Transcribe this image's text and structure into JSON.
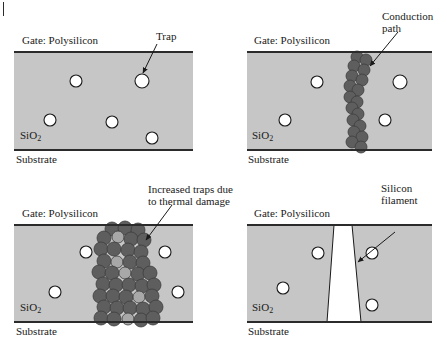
{
  "figure": {
    "type": "diagram",
    "page_tick": "|",
    "colors": {
      "oxide_fill": "#c6c6c6",
      "oxide_border": "#2b2b2b",
      "trap_fill": "#ffffff",
      "trap_stroke": "#1a1a1a",
      "defect_dark": "#5e5e5e",
      "defect_light": "#a8a8a8",
      "filament_fill": "#ffffff",
      "text": "#1a1a1a",
      "background": "#ffffff"
    },
    "common_labels": {
      "gate": "Gate: Polysilicon",
      "oxide": "SiO",
      "oxide_subscript": "2",
      "substrate": "Substrate"
    }
  },
  "panels": [
    {
      "id": "panel-a",
      "position": "top-left",
      "gate_label": "Gate: Polysilicon",
      "oxide_label": "SiO",
      "oxide_subscript": "2",
      "substrate_label": "Substrate",
      "callout": "Trap",
      "callout_lines": [
        "Trap"
      ],
      "description": "Pristine oxide with randomly distributed traps",
      "box": {
        "x": 14,
        "y": 52,
        "w": 179,
        "h": 98
      },
      "traps": [
        {
          "cx": 76,
          "cy": 81,
          "r": 6
        },
        {
          "cx": 142,
          "cy": 81,
          "r": 7
        },
        {
          "cx": 50,
          "cy": 120,
          "r": 6
        },
        {
          "cx": 112,
          "cy": 122,
          "r": 6
        },
        {
          "cx": 152,
          "cy": 138,
          "r": 6
        }
      ],
      "defects": [],
      "filament": null,
      "arrow": {
        "x1": 157,
        "y1": 44,
        "x2": 143,
        "y2": 73
      },
      "label_pos": {
        "x": 156,
        "y": 30
      },
      "gate_pos": {
        "x": 22,
        "y": 34
      },
      "oxide_pos": {
        "x": 20,
        "y": 129
      },
      "substrate_pos": {
        "x": 16,
        "y": 153
      }
    },
    {
      "id": "panel-b",
      "position": "top-right",
      "gate_label": "Gate: Polysilicon",
      "oxide_label": "SiO",
      "oxide_subscript": "2",
      "substrate_label": "Substrate",
      "callout": "Conduction path",
      "callout_lines": [
        "Conduction",
        "path"
      ],
      "description": "Traps align to form a percolation conduction path",
      "box": {
        "x": 247,
        "y": 52,
        "w": 185,
        "h": 98
      },
      "traps": [
        {
          "cx": 317,
          "cy": 82,
          "r": 6
        },
        {
          "cx": 400,
          "cy": 82,
          "r": 7
        },
        {
          "cx": 285,
          "cy": 120,
          "r": 6
        },
        {
          "cx": 385,
          "cy": 120,
          "r": 6
        }
      ],
      "defects": [
        {
          "cx": 357,
          "cy": 57,
          "r": 6,
          "shade": "dark"
        },
        {
          "cx": 366,
          "cy": 60,
          "r": 6,
          "shade": "dark"
        },
        {
          "cx": 354,
          "cy": 66,
          "r": 6,
          "shade": "dark"
        },
        {
          "cx": 364,
          "cy": 70,
          "r": 6,
          "shade": "dark"
        },
        {
          "cx": 352,
          "cy": 76,
          "r": 6,
          "shade": "dark"
        },
        {
          "cx": 362,
          "cy": 80,
          "r": 6,
          "shade": "dark"
        },
        {
          "cx": 350,
          "cy": 86,
          "r": 6,
          "shade": "dark"
        },
        {
          "cx": 358,
          "cy": 90,
          "r": 6,
          "shade": "dark"
        },
        {
          "cx": 350,
          "cy": 97,
          "r": 6,
          "shade": "dark"
        },
        {
          "cx": 357,
          "cy": 102,
          "r": 6,
          "shade": "dark"
        },
        {
          "cx": 352,
          "cy": 108,
          "r": 6,
          "shade": "dark"
        },
        {
          "cx": 358,
          "cy": 114,
          "r": 6,
          "shade": "dark"
        },
        {
          "cx": 353,
          "cy": 120,
          "r": 6,
          "shade": "dark"
        },
        {
          "cx": 360,
          "cy": 126,
          "r": 6,
          "shade": "dark"
        },
        {
          "cx": 354,
          "cy": 132,
          "r": 6,
          "shade": "dark"
        },
        {
          "cx": 362,
          "cy": 137,
          "r": 6,
          "shade": "dark"
        },
        {
          "cx": 352,
          "cy": 142,
          "r": 6,
          "shade": "dark"
        },
        {
          "cx": 361,
          "cy": 147,
          "r": 6,
          "shade": "dark"
        }
      ],
      "filament": null,
      "arrow": {
        "x1": 398,
        "y1": 32,
        "x2": 370,
        "y2": 66
      },
      "label_pos": {
        "x": 382,
        "y": 10
      },
      "gate_pos": {
        "x": 254,
        "y": 34
      },
      "oxide_pos": {
        "x": 252,
        "y": 129
      },
      "substrate_pos": {
        "x": 248,
        "y": 153
      }
    },
    {
      "id": "panel-c",
      "position": "bottom-left",
      "gate_label": "Gate: Polysilicon",
      "oxide_label": "SiO",
      "oxide_subscript": "2",
      "substrate_label": "Substrate",
      "callout": "Increased traps due to thermal damage",
      "callout_lines": [
        "Increased traps due",
        "to thermal damage"
      ],
      "description": "Thermal damage multiplies traps into a wide damaged band",
      "box": {
        "x": 14,
        "y": 225,
        "w": 179,
        "h": 97
      },
      "traps": [
        {
          "cx": 86,
          "cy": 252,
          "r": 6
        },
        {
          "cx": 165,
          "cy": 252,
          "r": 6
        },
        {
          "cx": 55,
          "cy": 292,
          "r": 6
        },
        {
          "cx": 178,
          "cy": 292,
          "r": 6
        }
      ],
      "defects": [
        {
          "cx": 112,
          "cy": 229,
          "r": 7,
          "shade": "dark"
        },
        {
          "cx": 125,
          "cy": 228,
          "r": 7,
          "shade": "dark"
        },
        {
          "cx": 138,
          "cy": 230,
          "r": 7,
          "shade": "dark"
        },
        {
          "cx": 104,
          "cy": 238,
          "r": 7,
          "shade": "dark"
        },
        {
          "cx": 118,
          "cy": 237,
          "r": 6,
          "shade": "light"
        },
        {
          "cx": 131,
          "cy": 239,
          "r": 7,
          "shade": "dark"
        },
        {
          "cx": 144,
          "cy": 240,
          "r": 7,
          "shade": "dark"
        },
        {
          "cx": 101,
          "cy": 249,
          "r": 7,
          "shade": "dark"
        },
        {
          "cx": 114,
          "cy": 249,
          "r": 7,
          "shade": "dark"
        },
        {
          "cx": 128,
          "cy": 250,
          "r": 7,
          "shade": "dark"
        },
        {
          "cx": 141,
          "cy": 252,
          "r": 7,
          "shade": "dark"
        },
        {
          "cx": 104,
          "cy": 261,
          "r": 7,
          "shade": "dark"
        },
        {
          "cx": 117,
          "cy": 262,
          "r": 6,
          "shade": "light"
        },
        {
          "cx": 130,
          "cy": 262,
          "r": 7,
          "shade": "dark"
        },
        {
          "cx": 143,
          "cy": 263,
          "r": 7,
          "shade": "dark"
        },
        {
          "cx": 99,
          "cy": 272,
          "r": 7,
          "shade": "dark"
        },
        {
          "cx": 112,
          "cy": 273,
          "r": 7,
          "shade": "dark"
        },
        {
          "cx": 125,
          "cy": 273,
          "r": 6,
          "shade": "light"
        },
        {
          "cx": 138,
          "cy": 274,
          "r": 7,
          "shade": "dark"
        },
        {
          "cx": 150,
          "cy": 273,
          "r": 7,
          "shade": "dark"
        },
        {
          "cx": 103,
          "cy": 284,
          "r": 7,
          "shade": "dark"
        },
        {
          "cx": 116,
          "cy": 285,
          "r": 7,
          "shade": "dark"
        },
        {
          "cx": 129,
          "cy": 285,
          "r": 7,
          "shade": "dark"
        },
        {
          "cx": 142,
          "cy": 286,
          "r": 7,
          "shade": "dark"
        },
        {
          "cx": 154,
          "cy": 285,
          "r": 7,
          "shade": "dark"
        },
        {
          "cx": 100,
          "cy": 296,
          "r": 7,
          "shade": "dark"
        },
        {
          "cx": 113,
          "cy": 296,
          "r": 7,
          "shade": "dark"
        },
        {
          "cx": 126,
          "cy": 297,
          "r": 7,
          "shade": "dark"
        },
        {
          "cx": 139,
          "cy": 297,
          "r": 6,
          "shade": "light"
        },
        {
          "cx": 152,
          "cy": 296,
          "r": 7,
          "shade": "dark"
        },
        {
          "cx": 104,
          "cy": 307,
          "r": 7,
          "shade": "dark"
        },
        {
          "cx": 117,
          "cy": 308,
          "r": 7,
          "shade": "dark"
        },
        {
          "cx": 130,
          "cy": 308,
          "r": 7,
          "shade": "dark"
        },
        {
          "cx": 143,
          "cy": 309,
          "r": 7,
          "shade": "dark"
        },
        {
          "cx": 156,
          "cy": 307,
          "r": 7,
          "shade": "dark"
        },
        {
          "cx": 101,
          "cy": 318,
          "r": 7,
          "shade": "dark"
        },
        {
          "cx": 114,
          "cy": 319,
          "r": 7,
          "shade": "dark"
        },
        {
          "cx": 128,
          "cy": 319,
          "r": 6,
          "shade": "light"
        },
        {
          "cx": 141,
          "cy": 320,
          "r": 7,
          "shade": "dark"
        },
        {
          "cx": 153,
          "cy": 318,
          "r": 7,
          "shade": "dark"
        }
      ],
      "filament": null,
      "arrow": {
        "x1": 172,
        "y1": 205,
        "x2": 146,
        "y2": 240
      },
      "label_pos": {
        "x": 148,
        "y": 183
      },
      "gate_pos": {
        "x": 22,
        "y": 207
      },
      "oxide_pos": {
        "x": 20,
        "y": 301
      },
      "substrate_pos": {
        "x": 16,
        "y": 325
      }
    },
    {
      "id": "panel-d",
      "position": "bottom-right",
      "gate_label": "Gate: Polysilicon",
      "oxide_label": "SiO",
      "oxide_subscript": "2",
      "substrate_label": "Substrate",
      "callout": "Silicon filament",
      "callout_lines": [
        "Silicon",
        "filament"
      ],
      "description": "Molten silicon filament shorts gate to substrate",
      "box": {
        "x": 247,
        "y": 225,
        "w": 185,
        "h": 97
      },
      "traps": [
        {
          "cx": 318,
          "cy": 253,
          "r": 6
        },
        {
          "cx": 372,
          "cy": 253,
          "r": 6
        },
        {
          "cx": 283,
          "cy": 288,
          "r": 6
        },
        {
          "cx": 372,
          "cy": 305,
          "r": 6
        }
      ],
      "defects": [],
      "filament": {
        "top_left": 334,
        "top_right": 352,
        "bottom_left": 327,
        "bottom_right": 361
      },
      "arrow": {
        "x1": 395,
        "y1": 232,
        "x2": 358,
        "y2": 262
      },
      "label_pos": {
        "x": 381,
        "y": 182
      },
      "gate_pos": {
        "x": 254,
        "y": 207
      },
      "oxide_pos": {
        "x": 252,
        "y": 301
      },
      "substrate_pos": {
        "x": 248,
        "y": 325
      }
    }
  ]
}
